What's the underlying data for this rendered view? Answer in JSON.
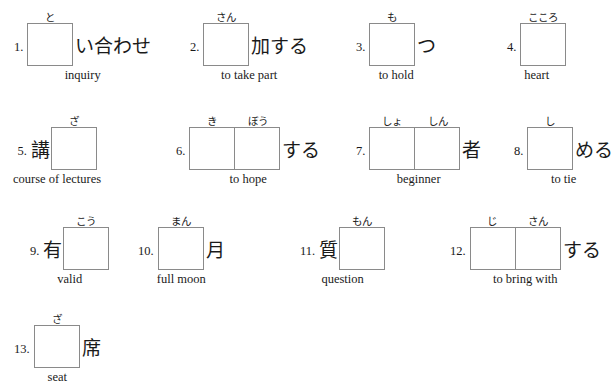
{
  "worksheet": {
    "title": "Kanji fill-in-the-blank practice worksheet",
    "box_border_color": "#8a8a8a",
    "text_color": "#1a1a1a",
    "background_color": "#ffffff"
  },
  "items": [
    {
      "number": "1.",
      "prefix": "",
      "furigana": [
        "と"
      ],
      "boxes": 1,
      "suffix": "い合わせ",
      "meaning": "inquiry",
      "x": 14,
      "y": 8
    },
    {
      "number": "2.",
      "prefix": "",
      "furigana": [
        "さん"
      ],
      "boxes": 1,
      "suffix": "加する",
      "meaning": "to take part",
      "x": 190,
      "y": 8
    },
    {
      "number": "3.",
      "prefix": "",
      "furigana": [
        "も"
      ],
      "boxes": 1,
      "suffix": "つ",
      "meaning": "to hold",
      "x": 356,
      "y": 8
    },
    {
      "number": "4.",
      "prefix": "",
      "furigana": [
        "こころ"
      ],
      "boxes": 1,
      "suffix": "",
      "meaning": "heart",
      "x": 507,
      "y": 8
    },
    {
      "number": "5.",
      "prefix": "講",
      "furigana": [
        "ざ"
      ],
      "boxes": 1,
      "suffix": "",
      "meaning": "course of lectures",
      "x": 13,
      "y": 112
    },
    {
      "number": "6.",
      "prefix": "",
      "furigana": [
        "き",
        "ぼう"
      ],
      "boxes": 2,
      "suffix": "する",
      "meaning": "to hope",
      "x": 176,
      "y": 112
    },
    {
      "number": "7.",
      "prefix": "",
      "furigana": [
        "しょ",
        "しん"
      ],
      "boxes": 2,
      "suffix": "者",
      "meaning": "beginner",
      "x": 356,
      "y": 112
    },
    {
      "number": "8.",
      "prefix": "",
      "furigana": [
        "し"
      ],
      "boxes": 1,
      "suffix": "める",
      "meaning": "to tie",
      "x": 514,
      "y": 112
    },
    {
      "number": "9.",
      "prefix": "有",
      "furigana": [
        "こう"
      ],
      "boxes": 1,
      "suffix": "",
      "meaning": "valid",
      "x": 30,
      "y": 212
    },
    {
      "number": "10.",
      "prefix": "",
      "furigana": [
        "まん"
      ],
      "boxes": 1,
      "suffix": "月",
      "meaning": "full moon",
      "x": 138,
      "y": 212
    },
    {
      "number": "11.",
      "prefix": "質",
      "furigana": [
        "もん"
      ],
      "boxes": 1,
      "suffix": "",
      "meaning": "question",
      "x": 300,
      "y": 212
    },
    {
      "number": "12.",
      "prefix": "",
      "furigana": [
        "じ",
        "さん"
      ],
      "boxes": 2,
      "suffix": "する",
      "meaning": "to bring with",
      "x": 450,
      "y": 212
    },
    {
      "number": "13.",
      "prefix": "",
      "furigana": [
        "ざ"
      ],
      "boxes": 1,
      "suffix": "席",
      "meaning": "seat",
      "x": 14,
      "y": 310
    }
  ]
}
